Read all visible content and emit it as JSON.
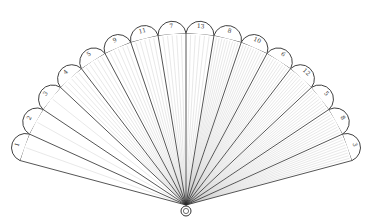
{
  "diagram": {
    "type": "fan",
    "pivot": {
      "x": 186,
      "y": 205
    },
    "labels": [
      "1",
      "2",
      "3",
      "4",
      "5",
      "9",
      "11",
      "7",
      "13",
      "8",
      "10",
      "6",
      "12",
      "5",
      "8",
      "3"
    ],
    "colors": {
      "line": "#2a2a2a",
      "shade": "#bdbdbd",
      "background": "#ffffff"
    }
  }
}
